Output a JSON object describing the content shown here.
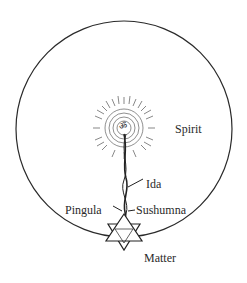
{
  "diagram": {
    "labels": {
      "spirit": "Spirit",
      "ida": "Ida",
      "pingula": "Pingula",
      "sushumna": "Sushumna",
      "matter": "Matter"
    },
    "center_symbol": "ॐ",
    "colors": {
      "ink": "#2a2a2a",
      "background": "#ffffff"
    }
  }
}
